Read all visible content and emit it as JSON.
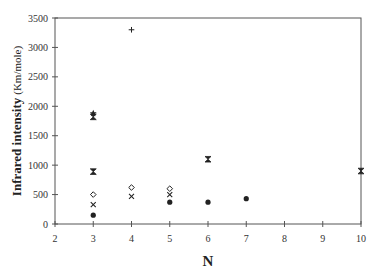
{
  "chart_data": {
    "type": "scatter",
    "title": "",
    "xlabel": "N",
    "ylabel": "Infrared intensity",
    "ylabel_unit": "(Km/mole)",
    "xlim": [
      2,
      10
    ],
    "ylim": [
      0,
      3500
    ],
    "xticks": [
      2,
      3,
      4,
      5,
      6,
      7,
      8,
      9,
      10
    ],
    "yticks": [
      0,
      500,
      1000,
      1500,
      2000,
      2500,
      3000,
      3500
    ],
    "grid": false,
    "legend": null,
    "series": [
      {
        "name": "filled-circle",
        "marker": "filled-circle",
        "points": [
          [
            3,
            150
          ],
          [
            5,
            370
          ],
          [
            6,
            370
          ],
          [
            7,
            430
          ]
        ]
      },
      {
        "name": "cross",
        "marker": "x",
        "points": [
          [
            3,
            330
          ],
          [
            4,
            470
          ],
          [
            5,
            500
          ]
        ]
      },
      {
        "name": "open-diamond",
        "marker": "open-diamond",
        "points": [
          [
            3,
            500
          ],
          [
            4,
            620
          ],
          [
            5,
            600
          ]
        ]
      },
      {
        "name": "hourglass",
        "marker": "hourglass",
        "points": [
          [
            3,
            890
          ],
          [
            3,
            1820
          ],
          [
            6,
            1100
          ],
          [
            10,
            900
          ]
        ]
      },
      {
        "name": "star",
        "marker": "filled-star",
        "points": [
          [
            3,
            1880
          ]
        ]
      },
      {
        "name": "plus",
        "marker": "plus",
        "points": [
          [
            4,
            3300
          ]
        ]
      }
    ]
  }
}
